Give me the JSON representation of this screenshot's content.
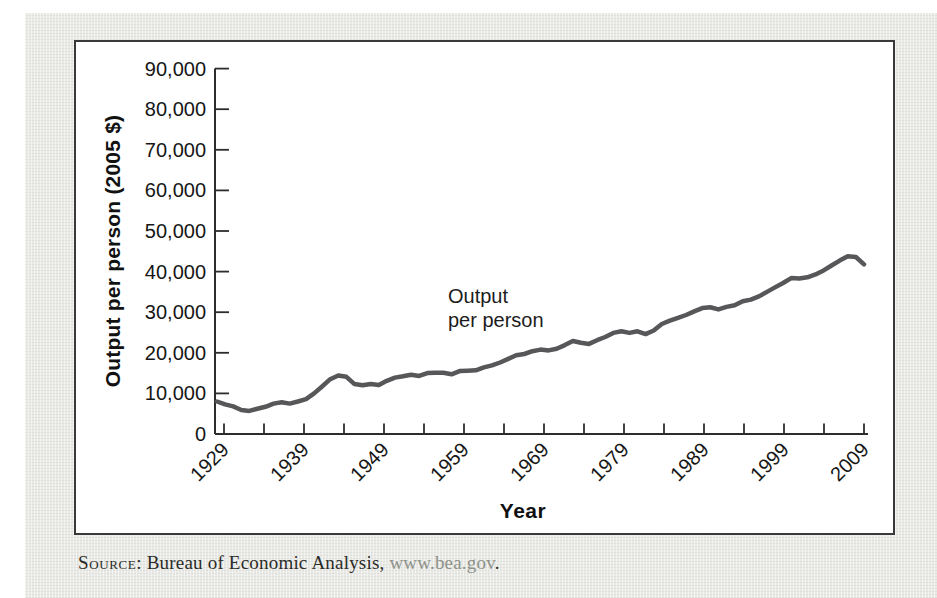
{
  "figure": {
    "background_color": "#e9e9e6",
    "box_border_color": "#3a3a3a",
    "box_background": "#ffffff"
  },
  "chart_data": {
    "type": "line",
    "title": "",
    "xlabel": "Year",
    "ylabel": "Output per person (2005 $)",
    "xlim": [
      1929,
      2009
    ],
    "ylim": [
      0,
      90000
    ],
    "grid": false,
    "legend_position": "none",
    "x_major_ticks": [
      "1929",
      "1939",
      "1949",
      "1959",
      "1969",
      "1979",
      "1989",
      "1999",
      "2009"
    ],
    "x_minor_interval_years": 5,
    "y_tick_labels": [
      "0",
      "10,000",
      "20,000",
      "30,000",
      "40,000",
      "50,000",
      "60,000",
      "70,000",
      "80,000",
      "90,000"
    ],
    "y_tick_step": 10000,
    "annotation": {
      "line1": "Output",
      "line2": "per person"
    },
    "axis_color": "#2d2d2d",
    "series": [
      {
        "name": "Output per person",
        "color": "#57575a",
        "x": [
          1929,
          1930,
          1931,
          1932,
          1933,
          1934,
          1935,
          1936,
          1937,
          1938,
          1939,
          1940,
          1941,
          1942,
          1943,
          1944,
          1945,
          1946,
          1947,
          1948,
          1949,
          1950,
          1951,
          1952,
          1953,
          1954,
          1955,
          1956,
          1957,
          1958,
          1959,
          1960,
          1961,
          1962,
          1963,
          1964,
          1965,
          1966,
          1967,
          1968,
          1969,
          1970,
          1971,
          1972,
          1973,
          1974,
          1975,
          1976,
          1977,
          1978,
          1979,
          1980,
          1981,
          1982,
          1983,
          1984,
          1985,
          1986,
          1987,
          1988,
          1989,
          1990,
          1991,
          1992,
          1993,
          1994,
          1995,
          1996,
          1997,
          1998,
          1999,
          2000,
          2001,
          2002,
          2003,
          2004,
          2005,
          2006,
          2007,
          2008,
          2009
        ],
        "y": [
          8000,
          7300,
          6800,
          5900,
          5700,
          6200,
          6700,
          7500,
          7800,
          7500,
          8000,
          8600,
          10000,
          11700,
          13500,
          14400,
          14100,
          12300,
          12000,
          12300,
          12100,
          13100,
          13900,
          14200,
          14600,
          14300,
          15000,
          15100,
          15100,
          14700,
          15500,
          15600,
          15700,
          16400,
          16900,
          17600,
          18500,
          19400,
          19700,
          20400,
          20800,
          20600,
          21000,
          21900,
          22900,
          22500,
          22200,
          23100,
          23900,
          24900,
          25300,
          24900,
          25300,
          24600,
          25500,
          27100,
          27900,
          28600,
          29300,
          30200,
          31000,
          31200,
          30700,
          31300,
          31700,
          32700,
          33100,
          33900,
          35000,
          36100,
          37200,
          38400,
          38300,
          38600,
          39300,
          40300,
          41500,
          42700,
          43800,
          43600,
          41800
        ]
      }
    ]
  },
  "source_note": {
    "label": "Source",
    "separator": ": ",
    "text": "Bureau of Economic Analysis, ",
    "link": "www.bea.gov",
    "period": "."
  }
}
